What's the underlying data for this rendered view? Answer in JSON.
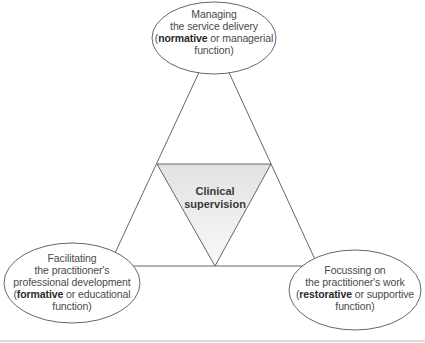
{
  "diagram": {
    "type": "triangle-model",
    "center": {
      "line1": "Clinical",
      "line2": "supervision"
    },
    "nodes": [
      {
        "id": "top",
        "lines": [
          "Managing",
          "the service delivery"
        ],
        "paren_open": "(",
        "keyword": "normative",
        "rest": " or managerial",
        "last_line": "function)"
      },
      {
        "id": "bottom-left",
        "lines": [
          "Facilitating",
          "the practitioner's",
          "professional development"
        ],
        "paren_open": "(",
        "keyword": "formative",
        "rest": " or educational",
        "last_line": "function)"
      },
      {
        "id": "bottom-right",
        "lines": [
          "Focussing on",
          "the practitioner's work"
        ],
        "paren_open": "(",
        "keyword": "restorative",
        "rest": " or supportive",
        "last_line": "function)"
      }
    ],
    "colors": {
      "stroke": "#555555",
      "inner_fill_top": "#e4e4e4",
      "inner_fill_bottom": "#f8f8f8",
      "bottom_rule": "#b5b5b5"
    }
  }
}
